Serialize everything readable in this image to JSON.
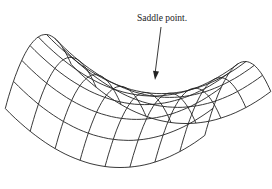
{
  "figure": {
    "annotation": {
      "text": "Saddle point.",
      "arrow": {
        "from": [
          161,
          27
        ],
        "to": [
          155,
          80
        ]
      }
    },
    "colors": {
      "line": "#222222",
      "background": "#ffffff"
    },
    "surface": {
      "equation": "z = x^2 - y^2",
      "grid_u": 9,
      "grid_v": 9
    }
  }
}
